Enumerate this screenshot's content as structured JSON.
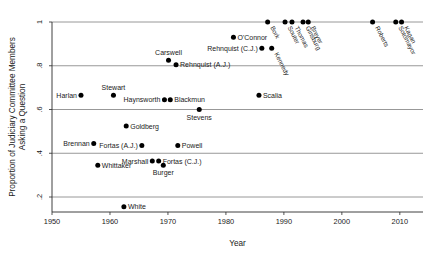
{
  "chart_data": {
    "type": "scatter",
    "title": "",
    "xlabel": "Year",
    "ylabel": "Proportion of Judiciary Committee Members Asking a Question",
    "ylabel_line1": "Proportion of Judiciary Committee Members",
    "ylabel_line2": "Asking a Question",
    "xlim": [
      1950,
      2014
    ],
    "ylim": [
      0.12,
      1.02
    ],
    "xticks": [
      1950,
      1960,
      1970,
      1980,
      1990,
      2000,
      2010
    ],
    "xtick_labels": [
      "1950",
      "1960",
      "1970",
      "1980",
      "1990",
      "2000",
      "2010"
    ],
    "yticks": [
      0.2,
      0.4,
      0.6,
      0.8,
      1.0
    ],
    "ytick_labels": [
      ".2",
      ".4",
      ".6",
      ".8",
      "1"
    ],
    "grid": "horizontal",
    "legend": "none",
    "marker_color": "#000000",
    "gridline_color": "#7d7d7d",
    "axis_color": "#2a2a2a",
    "points": [
      {
        "label": "Harlan",
        "year": 1955.0,
        "value": 0.665,
        "pos": "left",
        "rot": false
      },
      {
        "label": "Whittaker",
        "year": 1957.9,
        "value": 0.345,
        "pos": "right",
        "rot": false
      },
      {
        "label": "Stewart",
        "year": 1960.6,
        "value": 0.665,
        "pos": "above",
        "rot": false
      },
      {
        "label": "White",
        "year": 1962.4,
        "value": 0.155,
        "pos": "right",
        "rot": false
      },
      {
        "label": "Goldberg",
        "year": 1962.8,
        "value": 0.525,
        "pos": "right",
        "rot": false
      },
      {
        "label": "Brennan",
        "year": 1957.2,
        "value": 0.445,
        "pos": "left",
        "rot": false
      },
      {
        "label": "Fortas (A.J.)",
        "year": 1965.5,
        "value": 0.435,
        "pos": "left",
        "rot": false
      },
      {
        "label": "Marshall",
        "year": 1967.3,
        "value": 0.365,
        "pos": "left",
        "rot": false
      },
      {
        "label": "Fortas (C.J.)",
        "year": 1968.4,
        "value": 0.365,
        "pos": "right",
        "rot": false
      },
      {
        "label": "Burger",
        "year": 1969.2,
        "value": 0.345,
        "pos": "below",
        "rot": false
      },
      {
        "label": "Haynsworth",
        "year": 1969.4,
        "value": 0.645,
        "pos": "left",
        "rot": false
      },
      {
        "label": "Blackmun",
        "year": 1970.4,
        "value": 0.645,
        "pos": "right",
        "rot": false
      },
      {
        "label": "Carswell",
        "year": 1970.1,
        "value": 0.825,
        "pos": "above",
        "rot": false
      },
      {
        "label": "Rehnquist (A.J.)",
        "year": 1971.4,
        "value": 0.805,
        "pos": "right",
        "rot": false
      },
      {
        "label": "Powell",
        "year": 1971.7,
        "value": 0.435,
        "pos": "right",
        "rot": false
      },
      {
        "label": "Stevens",
        "year": 1975.4,
        "value": 0.6,
        "pos": "below",
        "rot": false
      },
      {
        "label": "O'Connor",
        "year": 1981.3,
        "value": 0.93,
        "pos": "right",
        "rot": false
      },
      {
        "label": "Scalia",
        "year": 1985.7,
        "value": 0.665,
        "pos": "right",
        "rot": false
      },
      {
        "label": "Rehnquist (C.J.)",
        "year": 1986.2,
        "value": 0.88,
        "pos": "left",
        "rot": false
      },
      {
        "label": "Bork",
        "year": 1987.2,
        "value": 1.0,
        "pos": "rot",
        "rot": true
      },
      {
        "label": "Kennedy",
        "year": 1987.9,
        "value": 0.88,
        "pos": "rot",
        "rot": true
      },
      {
        "label": "Souter",
        "year": 1990.2,
        "value": 1.0,
        "pos": "rot",
        "rot": true
      },
      {
        "label": "Thomas",
        "year": 1991.4,
        "value": 1.0,
        "pos": "rot",
        "rot": true
      },
      {
        "label": "Ginsburg",
        "year": 1993.3,
        "value": 1.0,
        "pos": "rot",
        "rot": true
      },
      {
        "label": "Breyer",
        "year": 1994.2,
        "value": 1.0,
        "pos": "rot",
        "rot": true
      },
      {
        "label": "Roberts",
        "year": 2005.3,
        "value": 1.0,
        "pos": "rot",
        "rot": true
      },
      {
        "label": "Sotomayor",
        "year": 2009.3,
        "value": 1.0,
        "pos": "rot",
        "rot": true
      },
      {
        "label": "Kagan",
        "year": 2010.3,
        "value": 1.0,
        "pos": "rot",
        "rot": true
      }
    ]
  }
}
